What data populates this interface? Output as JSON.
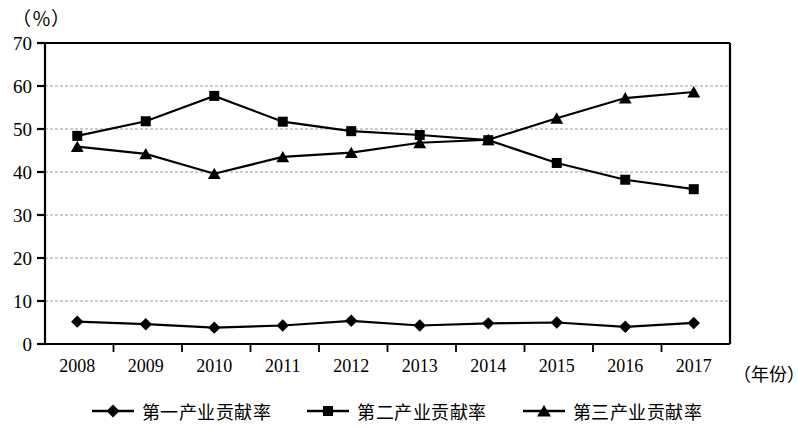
{
  "chart_data": {
    "type": "line",
    "title": "",
    "subtitle": "",
    "xlabel": "（年份）",
    "ylabel": "（％）",
    "categories": [
      "2008",
      "2009",
      "2010",
      "2011",
      "2012",
      "2013",
      "2014",
      "2015",
      "2016",
      "2017"
    ],
    "ylim": [
      0,
      70
    ],
    "ytick_step": 10,
    "yticks": [
      "0",
      "10",
      "20",
      "30",
      "40",
      "50",
      "60",
      "70"
    ],
    "grid": "horizontal-dashed",
    "legend_position": "bottom-center",
    "series": [
      {
        "name": "第一产业贡献率",
        "marker": "diamond",
        "color": "#000000",
        "values": [
          5.2,
          4.6,
          3.8,
          4.3,
          5.4,
          4.3,
          4.8,
          5.0,
          4.0,
          4.9
        ]
      },
      {
        "name": "第二产业贡献率",
        "marker": "square",
        "color": "#000000",
        "values": [
          48.4,
          51.8,
          57.7,
          51.7,
          49.5,
          48.6,
          47.4,
          42.1,
          38.2,
          36.0
        ]
      },
      {
        "name": "第三产业贡献率",
        "marker": "triangle",
        "color": "#000000",
        "values": [
          45.9,
          44.2,
          39.6,
          43.5,
          44.5,
          46.8,
          47.5,
          52.5,
          57.2,
          58.6
        ]
      }
    ]
  },
  "axis": {
    "unit_label": "（％）",
    "x_axis_title": "（年份）"
  },
  "legend": {
    "items": [
      {
        "label": "第一产业贡献率",
        "marker": "diamond-marker"
      },
      {
        "label": "第二产业贡献率",
        "marker": "square-marker"
      },
      {
        "label": "第三产业贡献率",
        "marker": "triangle-marker"
      }
    ]
  }
}
